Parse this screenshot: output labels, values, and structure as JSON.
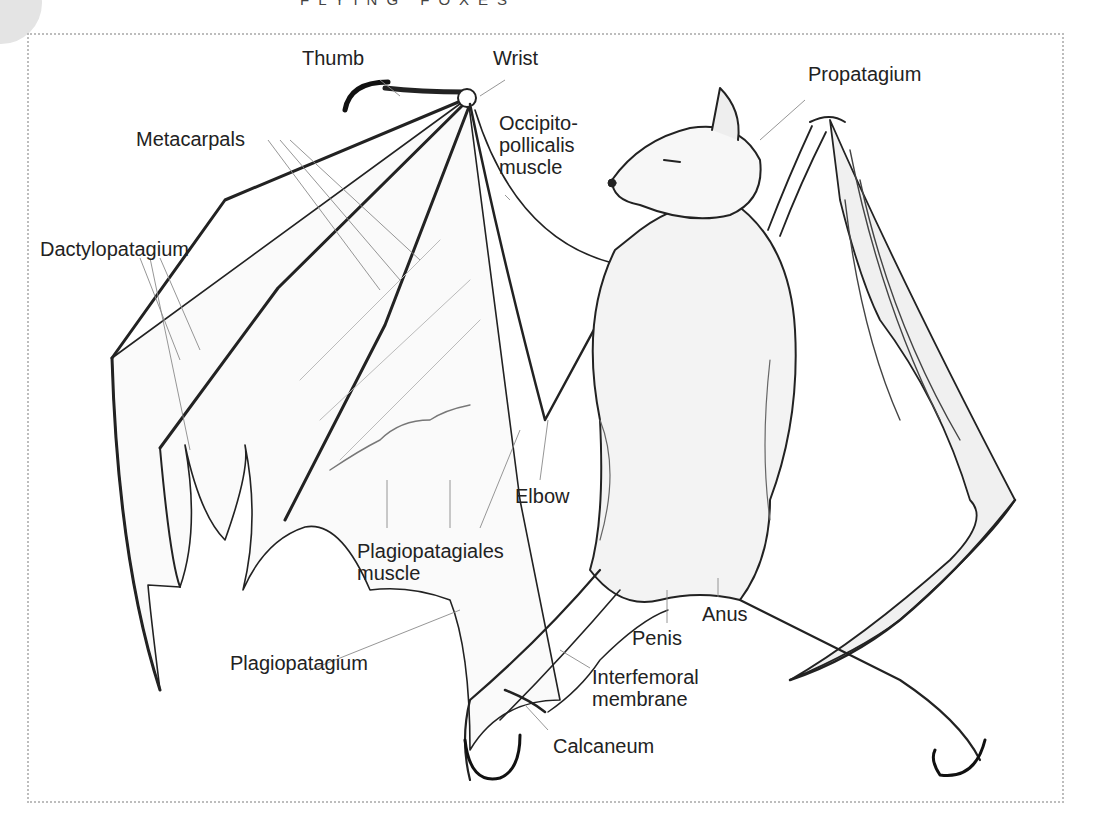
{
  "page": {
    "running_head": "FLYING FOXES"
  },
  "figure": {
    "colors": {
      "ink": "#222222",
      "frame": "#bdbdbd",
      "leader": "#8a8a8a",
      "shade": "#555555"
    },
    "labels": {
      "thumb": "Thumb",
      "wrist": "Wrist",
      "propatagium": "Propatagium",
      "metacarpals": "Metacarpals",
      "occipito_1": "Occipito-",
      "occipito_2": "pollicalis",
      "occipito_3": "muscle",
      "dactylopatagium": "Dactylopatagium",
      "elbow": "Elbow",
      "plagiopatagiales_1": "Plagiopatagiales",
      "plagiopatagiales_2": "muscle",
      "anus": "Anus",
      "penis": "Penis",
      "plagiopatagium": "Plagiopatagium",
      "interfemoral_1": "Interfemoral",
      "interfemoral_2": "membrane",
      "calcaneum": "Calcaneum"
    }
  }
}
